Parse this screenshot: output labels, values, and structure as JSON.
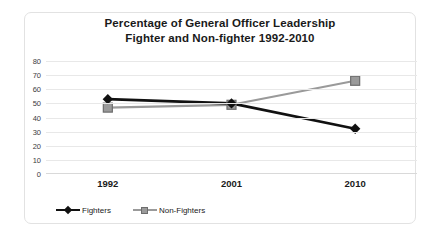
{
  "chart_data": {
    "type": "line",
    "title": "Percentage of General Officer Leadership Fighter and Non-fighter 1992-2010",
    "title_lines": [
      "Percentage of General Officer Leadership",
      "Fighter and Non-fighter 1992-2010"
    ],
    "categories": [
      "1992",
      "2001",
      "2010"
    ],
    "series": [
      {
        "name": "Fighters",
        "values": [
          53,
          50,
          32
        ],
        "color": "#111111",
        "marker": "diamond"
      },
      {
        "name": "Non-Fighters",
        "values": [
          47,
          49,
          66
        ],
        "color": "#9a9a9a",
        "marker": "square"
      }
    ],
    "xlabel": "",
    "ylabel": "",
    "ylim": [
      0,
      80
    ],
    "y_ticks": [
      80,
      70,
      60,
      50,
      40,
      30,
      20,
      10,
      0
    ],
    "grid": true,
    "legend_position": "bottom-left",
    "gridline_color": "#e8e8e8",
    "frame_color": "#e2e2e2",
    "background_color": "#ffffff"
  }
}
